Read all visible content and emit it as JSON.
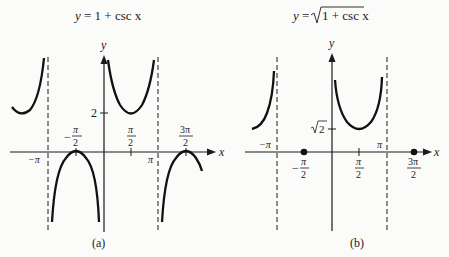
{
  "panels": [
    {
      "id": "a",
      "title_lhs": "y",
      "title_rhs": "= 1 + csc x",
      "caption": "(a)",
      "axis_x_label": "x",
      "axis_y_label": "y",
      "ticks_x": [
        "−π",
        "π/2",
        "π",
        "3π/2",
        "−π/2"
      ],
      "tick_y": "2",
      "minus_pi": "−π",
      "pi": "π",
      "neg_pi_half_minus": "−",
      "num_pi": "π",
      "num_3pi": "3π",
      "den_2": "2"
    },
    {
      "id": "b",
      "title_lhs": "y",
      "title_eq": "=",
      "title_radicand": "1 + csc x",
      "caption": "(b)",
      "axis_x_label": "x",
      "axis_y_label": "y",
      "tick_y_sqrt": "2",
      "minus_pi": "−π",
      "pi": "π",
      "neg_pi_half_minus": "−",
      "num_pi": "π",
      "num_3pi": "3π",
      "den_2": "2"
    }
  ]
}
